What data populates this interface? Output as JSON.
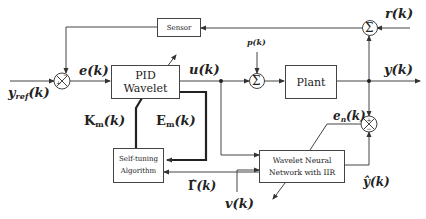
{
  "diagram": {
    "type": "control-block-diagram",
    "blocks": {
      "sensor": "Sensor",
      "pid": "PID Wavelet",
      "plant": "Plant",
      "self_tuning_line1": "Self-tuning",
      "self_tuning_line2": "Algorithm",
      "wnn_line1": "Wavelet Neural",
      "wnn_line2": "Network with IIR"
    },
    "signals": {
      "r": "r(k)",
      "e": "e(k)",
      "u": "u(k)",
      "p": "p(k)",
      "y": "y(k)",
      "yref_main": "y",
      "yref_sub": "ref",
      "yref_arg": "(k)",
      "en_main": "e",
      "en_sub": "n",
      "en_arg": "(k)",
      "km_main": "K",
      "km_sub": "m",
      "km_arg": "(k)",
      "em_main": "E",
      "em_sub": "m",
      "em_arg": "(k)",
      "gamma": "Γ̂",
      "gamma_arg": "(k)",
      "v": "v(k)",
      "yhat": "ŷ(k)"
    },
    "summing_symbols": {
      "sigma": "Σ"
    },
    "colors": {
      "line": "#444444",
      "thick_line": "#222222"
    }
  }
}
